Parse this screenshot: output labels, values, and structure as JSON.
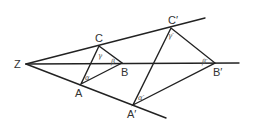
{
  "diagram": {
    "type": "geometric-construction",
    "colors": {
      "stroke": "#222222",
      "text": "#333333"
    },
    "center": {
      "label": "Z",
      "x": 26,
      "y": 64
    },
    "rays": [
      {
        "name": "ray-upper",
        "from": [
          26,
          64
        ],
        "to": [
          205,
          18
        ]
      },
      {
        "name": "ray-middle",
        "from": [
          26,
          64
        ],
        "to": [
          239,
          63
        ]
      },
      {
        "name": "ray-lower",
        "from": [
          26,
          64
        ],
        "to": [
          166,
          118
        ]
      }
    ],
    "small_triangle": {
      "vertices": {
        "A": {
          "label": "A",
          "x": 81,
          "y": 84
        },
        "B": {
          "label": "B",
          "x": 122,
          "y": 63
        },
        "C": {
          "label": "C",
          "x": 99,
          "y": 46
        }
      },
      "angles": {
        "alpha": "α",
        "beta": "β",
        "gamma": "γ"
      }
    },
    "large_triangle": {
      "vertices": {
        "A": {
          "label": "A′",
          "x": 133,
          "y": 105
        },
        "B": {
          "label": "B′",
          "x": 215,
          "y": 63
        },
        "C": {
          "label": "C′",
          "x": 171,
          "y": 28
        }
      },
      "angles": {
        "alpha": "α′",
        "beta": "β′",
        "gamma": "γ′"
      }
    }
  }
}
